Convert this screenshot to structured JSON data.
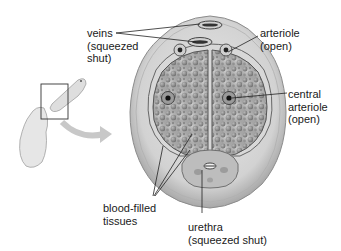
{
  "diagram": {
    "labels": {
      "veins": "veins\n(squeezed\nshut)",
      "arteriole": "arteriole\n(open)",
      "central_arteriole": "central\narteriole\n(open)",
      "blood_filled": "blood-filled\ntissues",
      "urethra": "urethra\n(squeezed shut)"
    },
    "colors": {
      "outer_ring": "#d4d4d4",
      "ring_edge": "#9a9a9a",
      "tissue_fill": "#b5b5b5",
      "sinus": "#8f8f8f",
      "line": "#222222",
      "arrow": "#c8c8c8"
    }
  }
}
